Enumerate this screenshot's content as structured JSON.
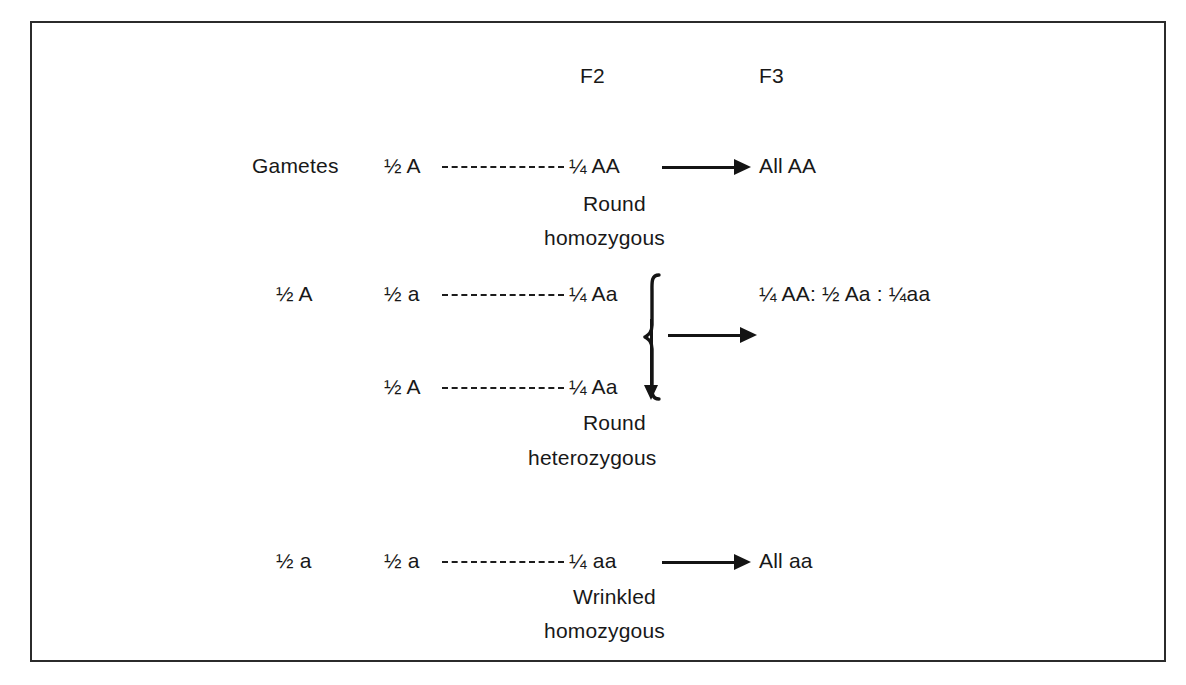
{
  "diagram": {
    "columns": {
      "f2_header": "F2",
      "f3_header": "F3"
    },
    "labels": {
      "gametes": "Gametes"
    },
    "rows": [
      {
        "id": "row-aa-homozygous",
        "left_gamete": "",
        "parent_gamete": "½ A",
        "f2_genotype": "¼ AA",
        "phenotype_line1": "Round",
        "phenotype_line2": "homozygous",
        "f3_result": "All AA"
      },
      {
        "id": "row-aa-hetero-top",
        "left_gamete": "½ A",
        "parent_gamete": "½ a",
        "f2_genotype": "¼ Aa",
        "phenotype_line1": "",
        "phenotype_line2": "",
        "f3_result": "¼ AA: ½ Aa : ¼aa"
      },
      {
        "id": "row-aa-hetero-bottom",
        "left_gamete": "",
        "parent_gamete": "½ A",
        "f2_genotype": "¼ Aa",
        "phenotype_line1": "Round",
        "phenotype_line2": "heterozygous",
        "f3_result": ""
      },
      {
        "id": "row-aa-wrinkled",
        "left_gamete": "½ a",
        "parent_gamete": "½ a",
        "f2_genotype": "¼ aa",
        "phenotype_line1": "Wrinkled",
        "phenotype_line2": "homozygous",
        "f3_result": "All aa"
      }
    ],
    "colors": {
      "ink": "#181818",
      "frame": "#2b2b2b",
      "background": "#ffffff"
    }
  }
}
